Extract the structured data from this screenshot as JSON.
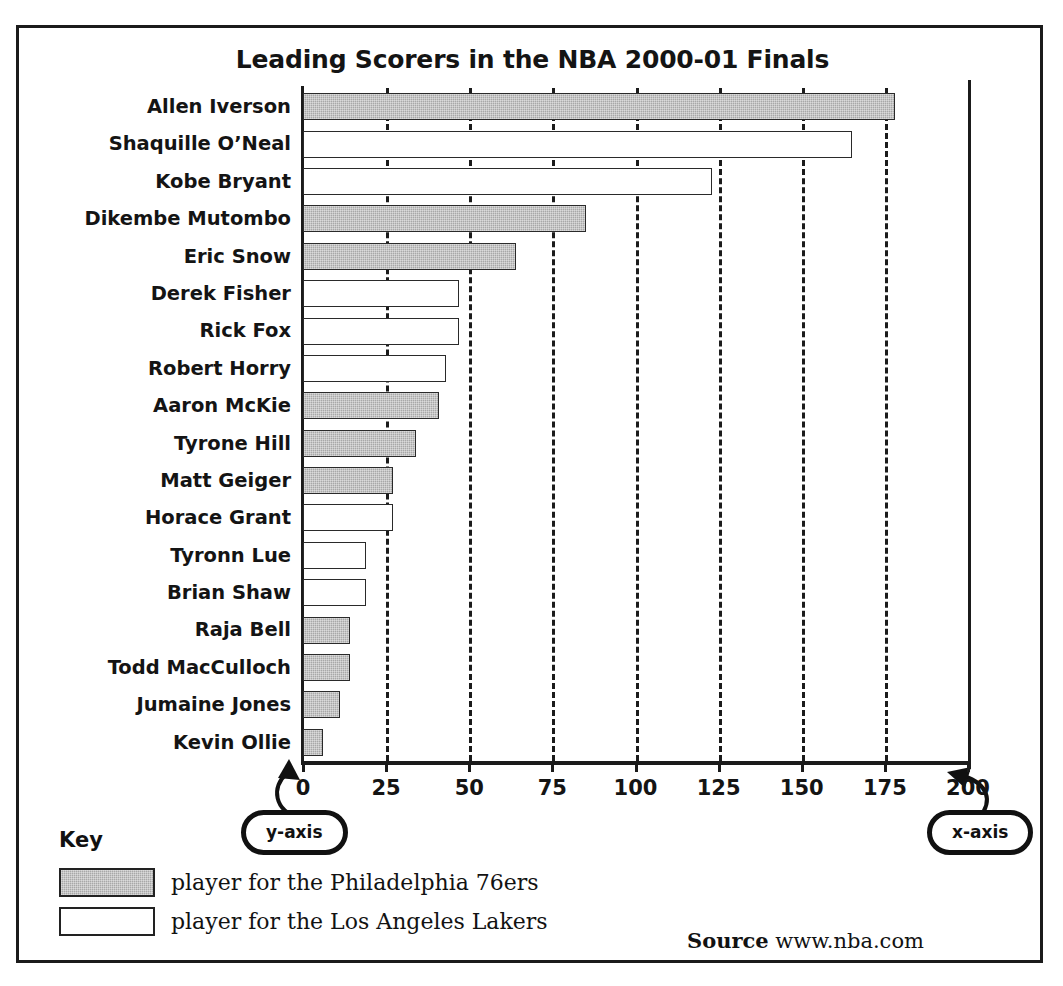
{
  "chart_data": {
    "type": "bar",
    "orientation": "horizontal",
    "title": "Leading Scorers in the NBA 2000-01 Finals",
    "xlabel": "",
    "ylabel": "",
    "xlim": [
      0,
      200
    ],
    "xticks": [
      0,
      25,
      50,
      75,
      100,
      125,
      150,
      175,
      200
    ],
    "grid": "vertical dashed gridlines at each 25-unit x tick",
    "legend_position": "below plot, left (labelled Key)",
    "categories": [
      "Allen Iverson",
      "Shaquille O’Neal",
      "Kobe Bryant",
      "Dikembe Mutombo",
      "Eric Snow",
      "Derek Fisher",
      "Rick Fox",
      "Robert Horry",
      "Aaron McKie",
      "Tyrone Hill",
      "Matt Geiger",
      "Horace Grant",
      "Tyronn Lue",
      "Brian Shaw",
      "Raja Bell",
      "Todd MacCulloch",
      "Jumaine Jones",
      "Kevin Ollie"
    ],
    "values": [
      178,
      165,
      123,
      85,
      64,
      47,
      47,
      43,
      41,
      34,
      27,
      27,
      19,
      19,
      14,
      14,
      11,
      6
    ],
    "teams": [
      "sixers",
      "lakers",
      "lakers",
      "sixers",
      "sixers",
      "lakers",
      "lakers",
      "lakers",
      "sixers",
      "sixers",
      "sixers",
      "lakers",
      "lakers",
      "lakers",
      "sixers",
      "sixers",
      "sixers",
      "sixers"
    ],
    "series": [
      {
        "name": "player for the Philadelphia 76ers",
        "key": "sixers",
        "color": "#a8a8a8",
        "points": [
          {
            "category": "Allen Iverson",
            "value": 178
          },
          {
            "category": "Dikembe Mutombo",
            "value": 85
          },
          {
            "category": "Eric Snow",
            "value": 64
          },
          {
            "category": "Aaron McKie",
            "value": 41
          },
          {
            "category": "Tyrone Hill",
            "value": 34
          },
          {
            "category": "Matt Geiger",
            "value": 27
          },
          {
            "category": "Raja Bell",
            "value": 14
          },
          {
            "category": "Todd MacCulloch",
            "value": 14
          },
          {
            "category": "Jumaine Jones",
            "value": 11
          },
          {
            "category": "Kevin Ollie",
            "value": 6
          }
        ]
      },
      {
        "name": "player for the Los Angeles Lakers",
        "key": "lakers",
        "color": "#ffffff",
        "points": [
          {
            "category": "Shaquille O’Neal",
            "value": 165
          },
          {
            "category": "Kobe Bryant",
            "value": 123
          },
          {
            "category": "Derek Fisher",
            "value": 47
          },
          {
            "category": "Rick Fox",
            "value": 47
          },
          {
            "category": "Robert Horry",
            "value": 43
          },
          {
            "category": "Horace Grant",
            "value": 27
          },
          {
            "category": "Tyronn Lue",
            "value": 19
          },
          {
            "category": "Brian Shaw",
            "value": 19
          }
        ]
      }
    ],
    "annotations": [
      {
        "name": "y-axis",
        "label": "y-axis",
        "points_to": "vertical category axis"
      },
      {
        "name": "x-axis",
        "label": "x-axis",
        "points_to": "horizontal value axis"
      }
    ]
  },
  "title": "Leading Scorers in the NBA 2000-01 Finals",
  "axis": {
    "x_ticks": [
      "0",
      "25",
      "50",
      "75",
      "100",
      "125",
      "150",
      "175",
      "200"
    ]
  },
  "callouts": {
    "y_axis": "y-axis",
    "x_axis": "x-axis"
  },
  "key": {
    "title": "Key",
    "entries": [
      {
        "label": "player for the Philadelphia 76ers",
        "swatch": "sixers"
      },
      {
        "label": "player for the Los Angeles Lakers",
        "swatch": "lakers"
      }
    ]
  },
  "source": {
    "label": "Source",
    "value": "www.nba.com"
  },
  "colors": {
    "sixers_fill": "#a8a8a8",
    "lakers_fill": "#ffffff",
    "ink": "#1b1b1b"
  }
}
